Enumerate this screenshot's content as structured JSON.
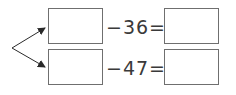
{
  "rows": [
    {
      "operation": "−36=",
      "input_value": "",
      "result_value": ""
    },
    {
      "operation": "−47=",
      "input_value": "",
      "result_value": ""
    }
  ],
  "colors": {
    "line": "#2a2a2a",
    "box_border": "#6f6f6f",
    "text": "#3a3a3a"
  }
}
